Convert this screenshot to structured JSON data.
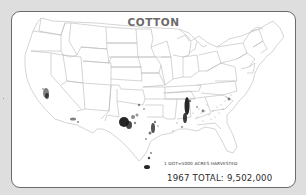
{
  "map": {
    "title": "COTTON",
    "legend": "1 DOT=5000 ACRES HARVESTED",
    "total_label": "1967 TOTAL: 9,502,000",
    "year": 1967,
    "total_acres": 9502000,
    "dot_value_acres": 5000,
    "region": "Contiguous United States",
    "colors": {
      "background": "#dedede",
      "card": "#ffffff",
      "border": "#6b6b6b",
      "state_lines": "#b8b8b8",
      "dots": "#1a1a1a",
      "title": "#6a6a6a"
    },
    "concentration_areas": [
      "California San Joaquin Valley",
      "Central Arizona",
      "Texas High Plains (Lubbock)",
      "Central Texas Blacklands",
      "Texas Lower Rio Grande Valley",
      "Mississippi Delta",
      "Alabama",
      "Georgia",
      "Carolinas"
    ]
  }
}
